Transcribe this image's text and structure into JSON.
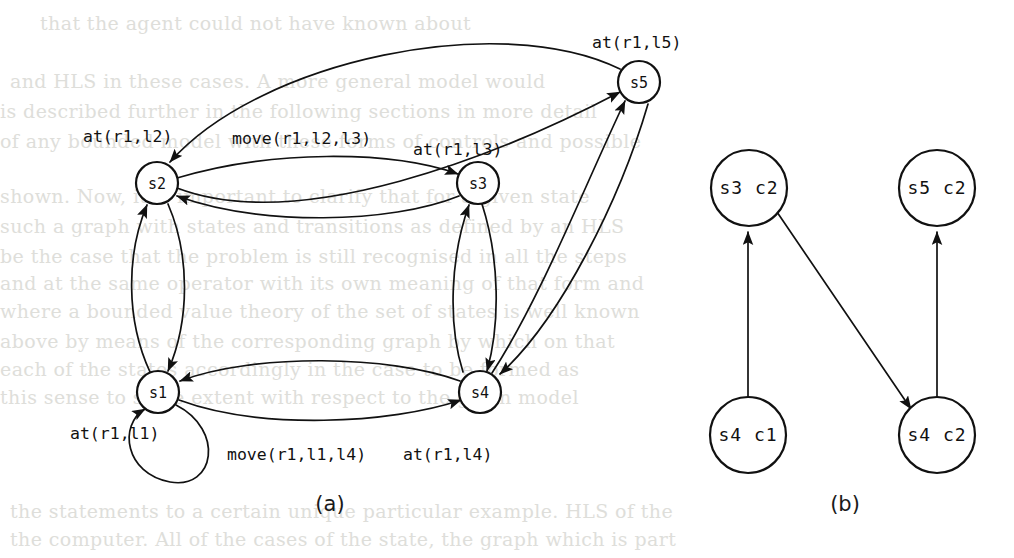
{
  "figure": {
    "captions": [
      {
        "id": "caption-a",
        "text": "(a)",
        "x": 330,
        "y": 505
      },
      {
        "id": "caption-b",
        "text": "(b)",
        "x": 845,
        "y": 505
      }
    ]
  },
  "panel_a": {
    "name": "state-transition-graph",
    "nodes": [
      {
        "id": "s1",
        "label": "s1",
        "x": 158,
        "y": 392,
        "r": 21
      },
      {
        "id": "s2",
        "label": "s2",
        "x": 157,
        "y": 183,
        "r": 21
      },
      {
        "id": "s3",
        "label": "s3",
        "x": 478,
        "y": 183,
        "r": 21
      },
      {
        "id": "s4",
        "label": "s4",
        "x": 480,
        "y": 392,
        "r": 21
      },
      {
        "id": "s5",
        "label": "s5",
        "x": 639,
        "y": 82,
        "r": 21
      }
    ],
    "annotations": [
      {
        "id": "annot-s5",
        "text": "at(r1,l5)",
        "x": 592,
        "y": 43
      },
      {
        "id": "annot-s2",
        "text": "at(r1,l2)",
        "x": 83,
        "y": 137
      },
      {
        "id": "annot-move-l2-l3",
        "text": "move(r1,l2,l3)",
        "x": 232,
        "y": 139
      },
      {
        "id": "annot-s3",
        "text": "at(r1,l3)",
        "x": 413,
        "y": 150
      },
      {
        "id": "annot-s1",
        "text": "at(r1,l1)",
        "x": 70,
        "y": 434
      },
      {
        "id": "annot-move-l1-l4",
        "text": "move(r1,l1,l4)",
        "x": 227,
        "y": 455
      },
      {
        "id": "annot-s4",
        "text": "at(r1,l4)",
        "x": 403,
        "y": 455
      }
    ],
    "edges": [
      {
        "from": "s1",
        "to": "s2"
      },
      {
        "from": "s2",
        "to": "s1"
      },
      {
        "from": "s2",
        "to": "s3"
      },
      {
        "from": "s3",
        "to": "s2"
      },
      {
        "from": "s2",
        "to": "s5"
      },
      {
        "from": "s5",
        "to": "s2"
      },
      {
        "from": "s3",
        "to": "s4"
      },
      {
        "from": "s4",
        "to": "s3"
      },
      {
        "from": "s1",
        "to": "s4"
      },
      {
        "from": "s4",
        "to": "s1"
      },
      {
        "from": "s4",
        "to": "s5"
      },
      {
        "from": "s5",
        "to": "s4"
      },
      {
        "from": "s1",
        "to": "s1"
      }
    ]
  },
  "panel_b": {
    "name": "policy-graph",
    "nodes": [
      {
        "id": "s3c2",
        "label": "s3 c2",
        "x": 749,
        "y": 188,
        "r": 38
      },
      {
        "id": "s5c2",
        "label": "s5 c2",
        "x": 937,
        "y": 188,
        "r": 38
      },
      {
        "id": "s4c1",
        "label": "s4 c1",
        "x": 748,
        "y": 435,
        "r": 38
      },
      {
        "id": "s4c2",
        "label": "s4 c2",
        "x": 937,
        "y": 435,
        "r": 38
      }
    ],
    "edges": [
      {
        "from": "s4c1",
        "to": "s3c2"
      },
      {
        "from": "s3c2",
        "to": "s4c2"
      },
      {
        "from": "s4c2",
        "to": "s5c2"
      }
    ]
  },
  "background_text": {
    "note": "faint show-through text from the reverse side of the scanned page",
    "lines": [
      {
        "text": "that the agent could not have known about",
        "x": 40,
        "y": 12
      },
      {
        "text": "and HLS in these cases. A more general model would",
        "x": 10,
        "y": 70
      },
      {
        "text": "is described further in the following sections in more detail",
        "x": 0,
        "y": 100
      },
      {
        "text": "of any bounded model with these forms of controls and possible",
        "x": 0,
        "y": 130
      },
      {
        "text": "shown. Now, it is important to clarify that for a given state",
        "x": 0,
        "y": 185
      },
      {
        "text": "such a graph with states and transitions as defined by an HLS",
        "x": 0,
        "y": 215
      },
      {
        "text": "be the case that the problem is still recognised in all the steps",
        "x": 0,
        "y": 245
      },
      {
        "text": "and at the same operator with its own meaning of that form and",
        "x": 0,
        "y": 272
      },
      {
        "text": "where a bounded value theory of the set of states is well known",
        "x": 0,
        "y": 300
      },
      {
        "text": "above by means of the corresponding graph by which on that",
        "x": 0,
        "y": 330
      },
      {
        "text": "each of the states accordingly in the case to be formed as",
        "x": 0,
        "y": 358
      },
      {
        "text": "this sense to some extent with respect to the given model",
        "x": 0,
        "y": 386
      },
      {
        "text": "the statements to a certain unique particular example. HLS of the",
        "x": 10,
        "y": 500
      },
      {
        "text": "the computer. All of the cases of the state, the graph which is part",
        "x": 10,
        "y": 528
      }
    ]
  },
  "colors": {
    "ink": "#111111",
    "paper": "#ffffff",
    "showthrough": "#dededa"
  }
}
